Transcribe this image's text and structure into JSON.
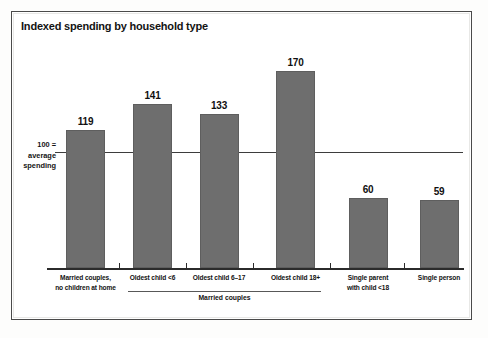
{
  "figure": {
    "title": "Indexed spending by household type",
    "reference_label_lines": [
      "100 =",
      "average",
      "spending"
    ],
    "group_label": "Married couples"
  },
  "chart_data": {
    "type": "bar",
    "title": "Indexed spending by household type",
    "xlabel": "",
    "ylabel": "",
    "categories": [
      "Married couples, no children at home",
      "Oldest child <6",
      "Oldest child 6–17",
      "Oldest child 18+",
      "Single parent with child <18",
      "Single person"
    ],
    "category_lines": [
      [
        "Married couples,",
        "no children at home"
      ],
      [
        "Oldest child <6"
      ],
      [
        "Oldest child 6–17"
      ],
      [
        "Oldest child 18+"
      ],
      [
        "Single parent",
        "with child <18"
      ],
      [
        "Single person"
      ]
    ],
    "values": [
      119,
      141,
      133,
      170,
      60,
      59
    ],
    "value_labels": [
      "119",
      "141",
      "133",
      "170",
      "60",
      "59"
    ],
    "reference_line": {
      "value": 100,
      "label": "100 = average spending"
    },
    "group_brackets": [
      {
        "label": "Married couples",
        "categories": [
          "Oldest child <6",
          "Oldest child 6–17",
          "Oldest child 18+"
        ]
      }
    ],
    "ylim": [
      0,
      195
    ],
    "grid": false,
    "legend": null,
    "bar_color": "#6e6e6e",
    "background": "#ffffff"
  }
}
